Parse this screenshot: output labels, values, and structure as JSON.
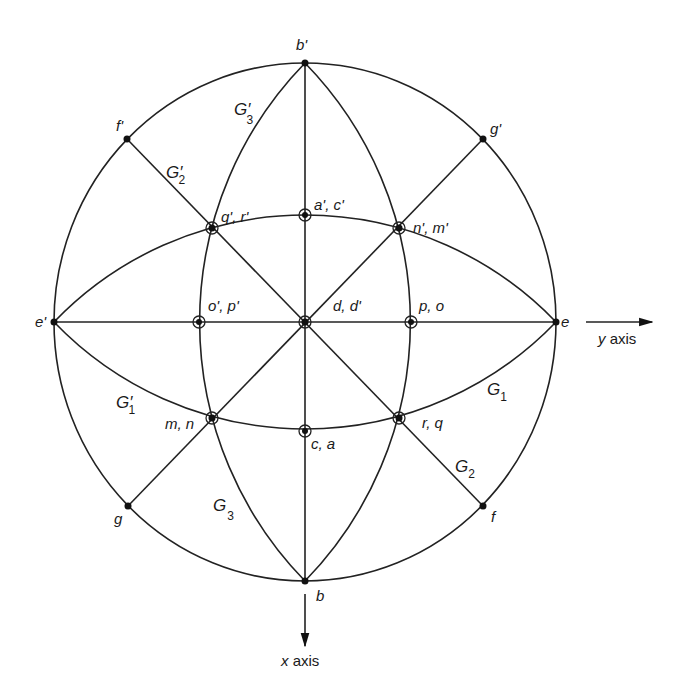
{
  "diagram": {
    "type": "stereographic projection of great circles (symmetry elements)",
    "center": {
      "label": "d, d'"
    },
    "primitive_points": {
      "top": "b'",
      "bottom": "b",
      "left": "e'",
      "right": "e",
      "upper_left": "f'",
      "upper_right": "g'",
      "lower_left": "g",
      "lower_right": "f"
    },
    "intersection_points": {
      "upper_mid": "a', c'",
      "lower_mid": "c, a",
      "left_mid": "o', p'",
      "right_mid": "p, o",
      "upper_left": "q', r'",
      "upper_right": "n', m'",
      "lower_left": "m, n",
      "lower_right": "r, q"
    },
    "great_circle_labels": {
      "G3_prime": {
        "base": "G",
        "prime": "′",
        "sub": "3"
      },
      "G2_prime": {
        "base": "G",
        "prime": "′",
        "sub": "2"
      },
      "G1_prime": {
        "base": "G",
        "prime": "′",
        "sub": "1"
      },
      "G1": {
        "base": "G",
        "prime": "",
        "sub": "1"
      },
      "G2": {
        "base": "G",
        "prime": "",
        "sub": "2"
      },
      "G3": {
        "base": "G",
        "prime": "",
        "sub": "3"
      }
    },
    "axes": {
      "y": {
        "var": "y",
        "word": "axis"
      },
      "x": {
        "var": "x",
        "word": "axis"
      }
    }
  }
}
